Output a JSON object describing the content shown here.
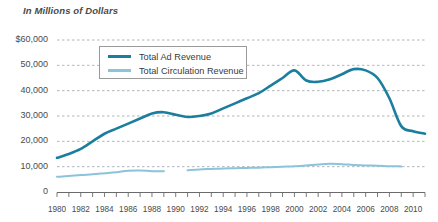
{
  "chart_data": {
    "type": "line",
    "title": "In Millions of Dollars",
    "xlabel": "",
    "ylabel": "",
    "xlim": [
      1980,
      2011
    ],
    "ylim": [
      0,
      60000
    ],
    "grid": true,
    "legend_position": "upper-left-inside",
    "y_ticks": [
      0,
      10000,
      20000,
      30000,
      40000,
      50000,
      60000
    ],
    "y_tick_labels": [
      "0",
      "10,000",
      "20,000",
      "30,000",
      "40,000",
      "50,000",
      "$60,000"
    ],
    "x_ticks": [
      1980,
      1982,
      1984,
      1986,
      1988,
      1990,
      1992,
      1994,
      1996,
      1998,
      2000,
      2002,
      2004,
      2006,
      2008,
      2010
    ],
    "x_tick_labels": [
      "1980",
      "1982",
      "1984",
      "1986",
      "1988",
      "1990",
      "1992",
      "1994",
      "1996",
      "1998",
      "2000",
      "2002",
      "2004",
      "2006",
      "2008",
      "2010"
    ],
    "x_minor_ticks": [
      1980,
      1981,
      1982,
      1983,
      1984,
      1985,
      1986,
      1987,
      1988,
      1989,
      1990,
      1991,
      1992,
      1993,
      1994,
      1995,
      1996,
      1997,
      1998,
      1999,
      2000,
      2001,
      2002,
      2003,
      2004,
      2005,
      2006,
      2007,
      2008,
      2009,
      2010,
      2011
    ],
    "series": [
      {
        "name": "Total Ad Revenue",
        "color": "#1b7e9e",
        "x": [
          1980,
          1981,
          1982,
          1983,
          1984,
          1985,
          1986,
          1987,
          1988,
          1989,
          1990,
          1991,
          1992,
          1993,
          1994,
          1995,
          1996,
          1997,
          1998,
          1999,
          2000,
          2001,
          2002,
          2003,
          2004,
          2005,
          2006,
          2007,
          2008,
          2009,
          2010,
          2011
        ],
        "values": [
          13500,
          15000,
          17000,
          20000,
          23000,
          25000,
          27000,
          29000,
          31000,
          31500,
          30500,
          29600,
          30000,
          31000,
          33000,
          35000,
          37000,
          39000,
          42000,
          45000,
          48000,
          44000,
          43500,
          44500,
          46500,
          48500,
          48000,
          45000,
          37000,
          26000,
          24000,
          23000
        ]
      },
      {
        "name": "Total Circulation Revenue",
        "color": "#8bc4da",
        "x": [
          1980,
          1981,
          1982,
          1983,
          1984,
          1985,
          1986,
          1987,
          1988,
          1989,
          null,
          1991,
          1992,
          1993,
          1994,
          1995,
          1996,
          1997,
          1998,
          1999,
          2000,
          2001,
          2002,
          2003,
          2004,
          2005,
          2006,
          2007,
          2008,
          2009
        ],
        "values": [
          6000,
          6300,
          6700,
          7000,
          7400,
          7800,
          8400,
          8500,
          8200,
          8200,
          null,
          8600,
          8900,
          9100,
          9300,
          9400,
          9500,
          9600,
          9800,
          10000,
          10200,
          10500,
          10900,
          11200,
          11000,
          10700,
          10500,
          10400,
          10200,
          10100
        ]
      }
    ]
  },
  "legend": {
    "items": [
      {
        "label": "Total Ad Revenue",
        "color": "#1b7e9e"
      },
      {
        "label": "Total Circulation Revenue",
        "color": "#8bc4da"
      }
    ]
  },
  "colors": {
    "ad_revenue": "#1b7e9e",
    "circulation_revenue": "#8bc4da",
    "gridline": "#9aa3ab",
    "axis": "#6b6b6b",
    "text": "#4a4a4a"
  }
}
